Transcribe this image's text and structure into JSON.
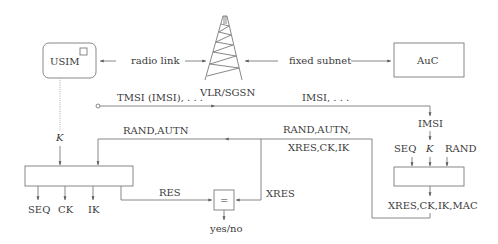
{
  "diagram": {
    "type": "authentication-flow",
    "nodes": {
      "usim": {
        "label": "USIM"
      },
      "tower": {
        "label": "VLR/SGSN"
      },
      "auc": {
        "label": "AuC"
      },
      "usim_function": {
        "label": ""
      },
      "auc_function": {
        "label": ""
      },
      "compare": {
        "label": "="
      }
    },
    "links": {
      "radio_link": "radio link",
      "fixed_subnet": "fixed subnet"
    },
    "messages": {
      "tmsi": "TMSI (IMSI), . . .",
      "imsi_fwd": "IMSI, . . .",
      "rand_autn": "RAND,AUTN",
      "auth_vector_1": "RAND,AUTN,",
      "auth_vector_2": "XRES,CK,IK",
      "res": "RES",
      "xres": "XRES"
    },
    "usim_side": {
      "key_input": "K",
      "outputs": [
        "SEQ",
        "CK",
        "IK"
      ]
    },
    "auc_side": {
      "imsi_input": "IMSI",
      "inputs": [
        "SEQ",
        "K",
        "RAND"
      ],
      "output": "XRES,CK,IK,MAC"
    },
    "result": "yes/no"
  }
}
